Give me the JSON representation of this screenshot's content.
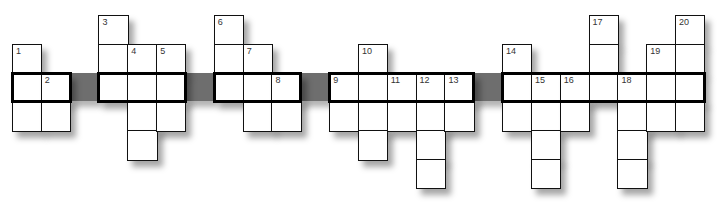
{
  "puzzle": {
    "type": "crossword",
    "cell_size": 28.83,
    "origin_x": 12,
    "origin_y": 15,
    "columns": 24,
    "main_row": 2,
    "block_color": "#6e6e6e",
    "blocks": [
      2,
      6,
      10,
      16
    ],
    "segments": [
      [
        0,
        1
      ],
      [
        3,
        5
      ],
      [
        7,
        9
      ],
      [
        11,
        15
      ],
      [
        17,
        23
      ]
    ],
    "column_spans": [
      {
        "col": 0,
        "from": 1,
        "to": 3,
        "number": "1",
        "number_row": 1
      },
      {
        "col": 1,
        "from": 2,
        "to": 3,
        "number": "2",
        "number_row": 2
      },
      {
        "col": 3,
        "from": 0,
        "to": 2,
        "number": "3",
        "number_row": 0
      },
      {
        "col": 4,
        "from": 1,
        "to": 4,
        "number": "4",
        "number_row": 1
      },
      {
        "col": 5,
        "from": 1,
        "to": 3,
        "number": "5",
        "number_row": 1
      },
      {
        "col": 7,
        "from": 0,
        "to": 2,
        "number": "6",
        "number_row": 0
      },
      {
        "col": 8,
        "from": 1,
        "to": 3,
        "number": "7",
        "number_row": 1
      },
      {
        "col": 9,
        "from": 2,
        "to": 3,
        "number": "8",
        "number_row": 2
      },
      {
        "col": 11,
        "from": 2,
        "to": 3,
        "number": "9",
        "number_row": 2
      },
      {
        "col": 12,
        "from": 1,
        "to": 4,
        "number": "10",
        "number_row": 1
      },
      {
        "col": 13,
        "from": 2,
        "to": 3,
        "number": "11",
        "number_row": 2
      },
      {
        "col": 14,
        "from": 2,
        "to": 5,
        "number": "12",
        "number_row": 2
      },
      {
        "col": 15,
        "from": 2,
        "to": 3,
        "number": "13",
        "number_row": 2
      },
      {
        "col": 17,
        "from": 1,
        "to": 3,
        "number": "14",
        "number_row": 1
      },
      {
        "col": 18,
        "from": 2,
        "to": 5,
        "number": "15",
        "number_row": 2
      },
      {
        "col": 19,
        "from": 2,
        "to": 3,
        "number": "16",
        "number_row": 2
      },
      {
        "col": 20,
        "from": 0,
        "to": 2,
        "number": "17",
        "number_row": 0
      },
      {
        "col": 21,
        "from": 2,
        "to": 5,
        "number": "18",
        "number_row": 2
      },
      {
        "col": 22,
        "from": 1,
        "to": 3,
        "number": "19",
        "number_row": 1
      },
      {
        "col": 23,
        "from": 0,
        "to": 3,
        "number": "20",
        "number_row": 0
      }
    ]
  }
}
